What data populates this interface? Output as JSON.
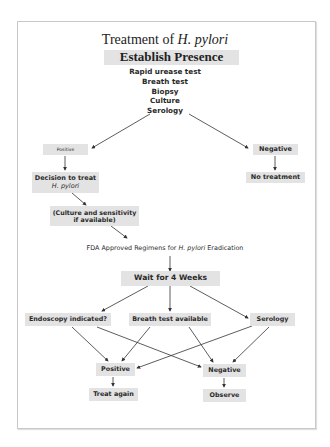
{
  "diagram": {
    "title_prefix": "Treatment of ",
    "title_italic": "H. pylori",
    "establish": "Establish Presence",
    "tests": [
      "Rapid urease test",
      "Breath test",
      "Biopsy",
      "Culture",
      "Serology"
    ],
    "positive_top": "Positive",
    "negative_top": "Negative",
    "decision_line1": "Decision to treat",
    "decision_line2": "H. pylori",
    "culture_line1": "(Culture and sensitivity",
    "culture_line2": "if available)",
    "no_treatment": "No treatment",
    "fda_prefix": "FDA Approved Regimens for ",
    "fda_italic": "H. pylori",
    "fda_suffix": " Eradication",
    "wait": "Wait for 4 Weeks",
    "endoscopy": "Endoscopy indicated?",
    "breath": "Breath test available",
    "serology": "Serology",
    "positive_bottom": "Positive",
    "negative_bottom": "Negative",
    "treat_again": "Treat again",
    "observe": "Observe"
  },
  "colors": {
    "box_fill": "#e3e3e3",
    "text": "#2a2a2a",
    "arrow": "#333333",
    "frame_border": "#c8c8c8"
  }
}
